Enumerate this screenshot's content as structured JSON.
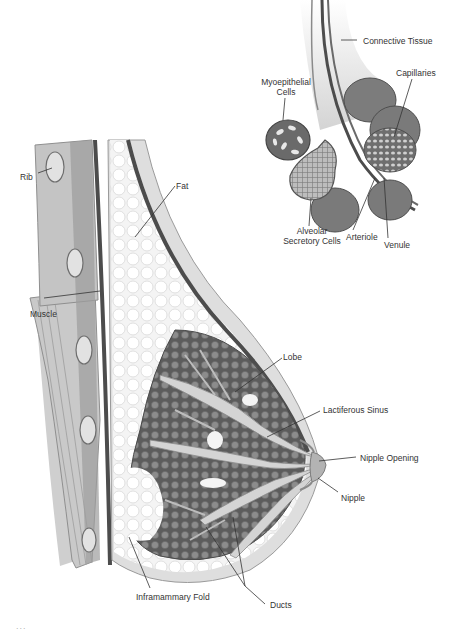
{
  "diagram": {
    "colors": {
      "background": "#ffffff",
      "skin": "#d9d9d9",
      "fat": "#f2f2f2",
      "tissue_dark": "#5a5a5a",
      "tissue_mid": "#8a8a8a",
      "label_text": "#333333"
    },
    "main_labels": {
      "rib": "Rib",
      "fat": "Fat",
      "muscle": "Muscle",
      "lobe": "Lobe",
      "lactiferous_sinus": "Lactiferous Sinus",
      "nipple_opening": "Nipple Opening",
      "nipple": "Nipple",
      "inframammary_fold": "Inframammary Fold",
      "ducts": "Ducts"
    },
    "inset_labels": {
      "connective_tissue": "Connective Tissue",
      "myoepithelial_cells_1": "Myoepithelial",
      "myoepithelial_cells_2": "Cells",
      "capillaries": "Capillaries",
      "alveolar_1": "Alveolar",
      "alveolar_2": "Secretory Cells",
      "arteriole": "Arteriole",
      "venule": "Venule"
    },
    "caption": "..."
  }
}
